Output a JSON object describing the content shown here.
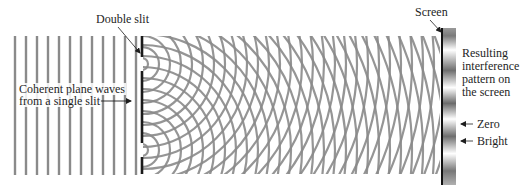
{
  "diagram": {
    "labels": {
      "double_slit": "Double slit",
      "plane_waves_line1": "Coherent plane waves",
      "plane_waves_line2": "from a single slit",
      "screen": "Screen",
      "result_line1": "Resulting",
      "result_line2": "interference",
      "result_line3": "pattern on",
      "result_line4": "the screen",
      "zero": "Zero",
      "bright": "Bright"
    },
    "geometry": {
      "plane_wave_count": 12,
      "plane_wave_start_x": 15,
      "plane_wave_spacing": 11,
      "wave_top": 36,
      "wave_bottom": 174,
      "barrier_x": 142,
      "slit_centers_y": [
        64,
        150
      ],
      "slit_half_gap": 7,
      "screen_x": 442,
      "screen_top": 28,
      "screen_bottom": 185,
      "arc_spacing": 11
    },
    "colors": {
      "wave": "#8a8a8a",
      "barrier": "#1a1a1a",
      "text": "#1e1e1e"
    },
    "screen_pattern": {
      "dark_bands_y": [
        36,
        70,
        103,
        136,
        170
      ]
    }
  }
}
